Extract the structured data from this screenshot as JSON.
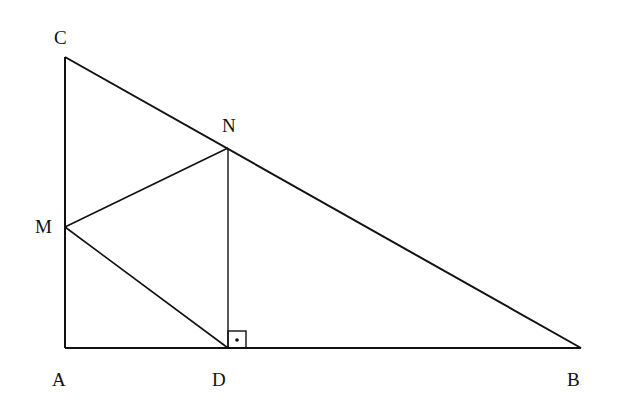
{
  "diagram": {
    "type": "geometry",
    "points": {
      "A": {
        "label": "A",
        "x": 65,
        "y": 348
      },
      "B": {
        "label": "B",
        "x": 581,
        "y": 348
      },
      "C": {
        "label": "C",
        "x": 65,
        "y": 57
      },
      "M": {
        "label": "M",
        "x": 65,
        "y": 227
      },
      "N": {
        "label": "N",
        "x": 228,
        "y": 148
      },
      "D": {
        "label": "D",
        "x": 228,
        "y": 348
      }
    },
    "segments": [
      "AB",
      "AC",
      "CB",
      "MN",
      "MD",
      "ND"
    ],
    "right_angle_marker": {
      "at": "D",
      "between": [
        "ND",
        "DB"
      ]
    }
  }
}
